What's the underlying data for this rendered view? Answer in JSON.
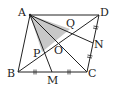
{
  "diagram": {
    "colors": {
      "line": "#222222",
      "shade": "#c8c8c8",
      "background": "#ffffff"
    },
    "points": {
      "A": {
        "label": "A",
        "x": 30,
        "y": 15
      },
      "B": {
        "label": "B",
        "x": 18,
        "y": 72
      },
      "C": {
        "label": "C",
        "x": 87,
        "y": 72
      },
      "D": {
        "label": "D",
        "x": 99,
        "y": 15
      },
      "M": {
        "label": "M",
        "x": 52,
        "y": 72
      },
      "N": {
        "label": "N",
        "x": 93,
        "y": 43
      },
      "O": {
        "label": "O",
        "x": 58,
        "y": 43
      },
      "P": {
        "label": "P",
        "x": 42,
        "y": 52
      },
      "Q": {
        "label": "Q",
        "x": 70,
        "y": 29
      }
    },
    "segments": [
      "AB",
      "BC",
      "CD",
      "DA",
      "AC",
      "BD",
      "AM",
      "AN"
    ],
    "shaded_region": [
      "A",
      "P",
      "Q"
    ],
    "tick_marks": [
      "BM",
      "MC",
      "CN",
      "ND"
    ]
  }
}
